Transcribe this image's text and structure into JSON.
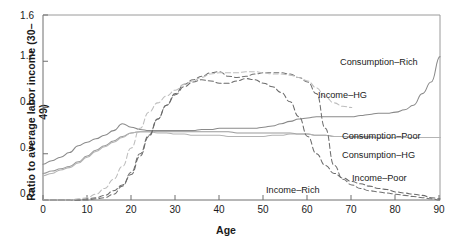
{
  "chart_data": {
    "type": "line",
    "title": "",
    "xlabel": "Age",
    "ylabel": "Ratio to average labor income (30–49)",
    "xlim": [
      0,
      90
    ],
    "ylim": [
      0.0,
      1.6
    ],
    "xticks": [
      "0",
      "10",
      "20",
      "30",
      "40",
      "50",
      "60",
      "70",
      "80",
      "90"
    ],
    "yticks": [
      "0.0",
      "0.4",
      "0.8",
      "1.2",
      "1.6"
    ],
    "grid": false,
    "legend_position": "inline-annotations",
    "x": [
      0,
      2,
      4,
      6,
      8,
      10,
      12,
      14,
      16,
      18,
      20,
      22,
      24,
      26,
      28,
      30,
      32,
      34,
      36,
      38,
      40,
      42,
      44,
      46,
      48,
      50,
      52,
      54,
      56,
      58,
      60,
      62,
      64,
      66,
      68,
      70,
      72,
      74,
      76,
      78,
      80,
      82,
      84,
      86,
      88,
      90
    ],
    "series": [
      {
        "name": "Consumption–Rich",
        "style": "solid",
        "color": "#8a8a8a",
        "values": [
          0.31,
          0.34,
          0.37,
          0.41,
          0.47,
          0.5,
          0.53,
          0.56,
          0.6,
          0.66,
          0.63,
          0.61,
          0.6,
          0.6,
          0.6,
          0.6,
          0.6,
          0.6,
          0.61,
          0.61,
          0.62,
          0.62,
          0.62,
          0.62,
          0.62,
          0.63,
          0.64,
          0.66,
          0.68,
          0.7,
          0.71,
          0.72,
          0.72,
          0.72,
          0.72,
          0.72,
          0.73,
          0.74,
          0.75,
          0.75,
          0.76,
          0.78,
          0.82,
          0.92,
          1.02,
          1.24
        ]
      },
      {
        "name": "Consumption–Poor",
        "style": "solid",
        "color": "#9a9a9a",
        "values": [
          0.23,
          0.25,
          0.27,
          0.29,
          0.33,
          0.38,
          0.43,
          0.47,
          0.51,
          0.55,
          0.58,
          0.59,
          0.59,
          0.59,
          0.59,
          0.59,
          0.59,
          0.59,
          0.59,
          0.59,
          0.59,
          0.59,
          0.58,
          0.58,
          0.58,
          0.58,
          0.58,
          0.58,
          0.58,
          0.57,
          0.57,
          0.56,
          0.56,
          0.55,
          0.55,
          0.55,
          0.55,
          0.55,
          0.54,
          0.54,
          0.54,
          0.54,
          0.54,
          0.54,
          0.54,
          0.54
        ]
      },
      {
        "name": "Consumption–HG",
        "style": "solid",
        "color": "#b4b4b4",
        "values": [
          0.21,
          0.23,
          0.26,
          0.28,
          0.32,
          0.37,
          0.42,
          0.46,
          0.5,
          0.54,
          0.58,
          0.59,
          0.59,
          0.58,
          0.58,
          0.57,
          0.57,
          0.56,
          0.56,
          0.56,
          0.56,
          0.55,
          0.55,
          0.55,
          0.55,
          0.55,
          0.56,
          0.56,
          0.57,
          0.57,
          0.57,
          0.56,
          0.56,
          0.55,
          0.55,
          0.54,
          0.54,
          0.54,
          0.54,
          0.54,
          0.54,
          0.54,
          0.54,
          0.54,
          0.54,
          0.54
        ]
      },
      {
        "name": "Income–Rich",
        "style": "dashed",
        "color": "#707070",
        "values": [
          0.0,
          0.0,
          0.0,
          0.0,
          0.0,
          0.0,
          0.01,
          0.02,
          0.05,
          0.12,
          0.24,
          0.4,
          0.56,
          0.7,
          0.82,
          0.92,
          1.0,
          1.04,
          1.07,
          1.1,
          1.11,
          1.07,
          1.06,
          1.07,
          1.09,
          1.1,
          1.1,
          1.1,
          1.09,
          1.06,
          1.02,
          0.92,
          0.62,
          0.3,
          0.18,
          0.13,
          0.1,
          0.08,
          0.07,
          0.06,
          0.05,
          0.04,
          0.03,
          0.02,
          0.01,
          0.0
        ]
      },
      {
        "name": "Income–Poor",
        "style": "dashed",
        "color": "#6a6a6a",
        "values": [
          0.0,
          0.0,
          0.0,
          0.0,
          0.0,
          0.01,
          0.02,
          0.04,
          0.08,
          0.13,
          0.22,
          0.38,
          0.55,
          0.7,
          0.82,
          0.91,
          0.98,
          1.02,
          1.04,
          1.03,
          1.01,
          1.01,
          1.03,
          1.05,
          1.04,
          1.01,
          0.98,
          0.93,
          0.85,
          0.72,
          0.55,
          0.4,
          0.3,
          0.23,
          0.19,
          0.16,
          0.14,
          0.12,
          0.1,
          0.09,
          0.07,
          0.06,
          0.05,
          0.04,
          0.02,
          0.01
        ]
      },
      {
        "name": "Income–HG",
        "style": "dashed",
        "color": "#bdbdbd",
        "values": [
          0.0,
          0.0,
          0.0,
          0.0,
          0.01,
          0.02,
          0.05,
          0.1,
          0.18,
          0.29,
          0.45,
          0.62,
          0.76,
          0.84,
          0.9,
          0.95,
          1.0,
          1.03,
          1.06,
          1.09,
          1.1,
          1.1,
          1.1,
          1.11,
          1.11,
          1.1,
          1.09,
          1.09,
          1.08,
          1.06,
          1.03,
          0.97,
          0.89,
          0.84,
          0.81,
          0.8,
          null,
          null,
          null,
          null,
          null,
          null,
          null,
          null,
          null,
          null
        ]
      }
    ],
    "annotations": [
      {
        "name": "consumption-rich-label",
        "text": "Consumption–Rich",
        "x_px": 340,
        "y_px": 57
      },
      {
        "name": "income-hg-label",
        "text": "Income–HG",
        "x_px": 318,
        "y_px": 90
      },
      {
        "name": "consumption-poor-label",
        "text": "Consumption–Poor",
        "x_px": 342,
        "y_px": 131
      },
      {
        "name": "consumption-hg-label",
        "text": "Consumption–HG",
        "x_px": 342,
        "y_px": 150
      },
      {
        "name": "income-poor-label",
        "text": "Income–Poor",
        "x_px": 352,
        "y_px": 173
      },
      {
        "name": "income-rich-label",
        "text": "Income–Rich",
        "x_px": 266,
        "y_px": 185
      }
    ]
  }
}
